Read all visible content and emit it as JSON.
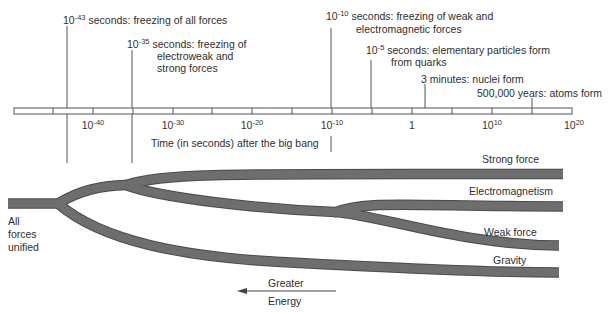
{
  "events": [
    {
      "exp": "-43",
      "prefix": "10",
      "text": "seconds: freezing of all forces",
      "lines": [],
      "x": 67
    },
    {
      "exp": "-35",
      "prefix": "10",
      "text": "seconds: freezing of",
      "lines": [
        "electroweak and",
        "strong forces"
      ],
      "x": 132
    },
    {
      "exp": "-10",
      "prefix": "10",
      "text": "seconds: freezing of weak and",
      "lines": [
        "electromagnetic forces"
      ],
      "x": 331
    },
    {
      "exp": "-5",
      "prefix": "10",
      "text": "seconds: elementary particles form",
      "lines": [
        "from quarks"
      ],
      "x": 371
    },
    {
      "exp": "",
      "prefix": "",
      "text": "3 minutes: nuclei form",
      "lines": [],
      "x": 425
    },
    {
      "exp": "",
      "prefix": "",
      "text": "500,000 years: atoms form",
      "lines": [],
      "x": 532
    }
  ],
  "axis": {
    "title": "Time (in seconds) after the big bang",
    "ticks": [
      {
        "base": "10",
        "exp": "-40",
        "x": 93
      },
      {
        "base": "10",
        "exp": "-30",
        "x": 173
      },
      {
        "base": "10",
        "exp": "-20",
        "x": 252
      },
      {
        "base": "10",
        "exp": "-10",
        "x": 332
      },
      {
        "base": "1",
        "exp": "",
        "x": 412
      },
      {
        "base": "10",
        "exp": "10",
        "x": 492
      },
      {
        "base": "10",
        "exp": "20",
        "x": 572
      }
    ]
  },
  "forces": {
    "unified_label": [
      "All",
      "forces",
      "unified"
    ],
    "strong": "Strong force",
    "em": "Electromagnetism",
    "weak": "Weak force",
    "gravity": "Gravity"
  },
  "energy_arrow": {
    "top": "Greater",
    "bottom": "Energy"
  },
  "colors": {
    "band": "#6e6e6e",
    "band_edge": "#4a4a4a",
    "line": "#555555",
    "text": "#2e2e2e"
  }
}
